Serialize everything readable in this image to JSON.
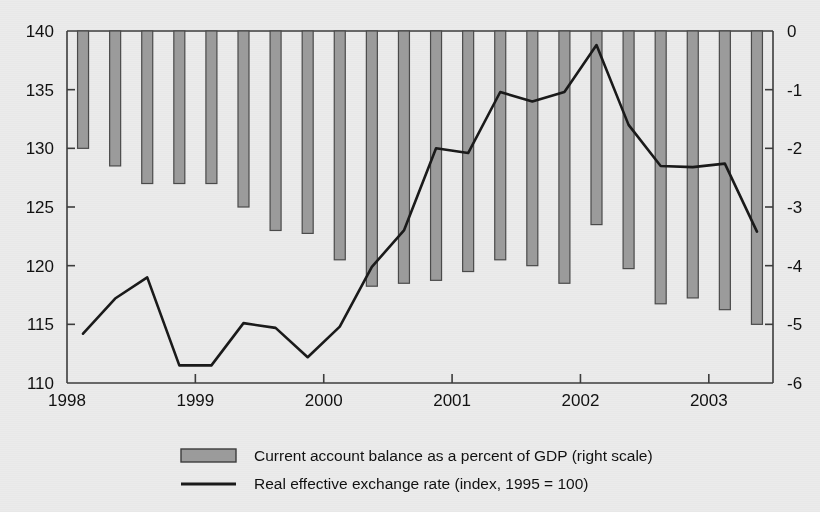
{
  "chart_data": {
    "type": "bar",
    "title": "",
    "subtitle": "",
    "xlabel": "",
    "ylabel": "",
    "grid": false,
    "legend_position": "bottom",
    "x_tick_labels": [
      "1998",
      "1999",
      "2000",
      "2001",
      "2002",
      "2003"
    ],
    "x_tick_values": [
      1998,
      1999,
      2000,
      2001,
      2002,
      2003
    ],
    "x_range": [
      1998.0,
      2003.5
    ],
    "left_axis": {
      "label": "Real effective exchange rate (index, 1995 = 100)",
      "ticks": [
        110,
        115,
        120,
        125,
        130,
        135,
        140
      ],
      "tick_labels": [
        "110",
        "115",
        "120",
        "125",
        "130",
        "135",
        "140"
      ],
      "ylim": [
        110,
        140
      ]
    },
    "right_axis": {
      "label": "Current account balance as a percent of GDP (right scale)",
      "ticks": [
        0,
        -1,
        -2,
        -3,
        -4,
        -5,
        -6
      ],
      "tick_labels": [
        "0",
        "-1",
        "-2",
        "-3",
        "-4",
        "-5",
        "-6"
      ],
      "ylim": [
        -6,
        0
      ]
    },
    "x": [
      1998.125,
      1998.375,
      1998.625,
      1998.875,
      1999.125,
      1999.375,
      1999.625,
      1999.875,
      2000.125,
      2000.375,
      2000.625,
      2000.875,
      2001.125,
      2001.375,
      2001.625,
      2001.875,
      2002.125,
      2002.375,
      2002.625,
      2002.875,
      2003.125,
      2003.375
    ],
    "series": [
      {
        "name": "Current account balance as a percent of GDP (right scale)",
        "axis": "right",
        "type": "bar",
        "color": "#9b9b9b",
        "edge_color": "#4a4a4a",
        "values": [
          -2.0,
          -2.3,
          -2.6,
          -2.6,
          -2.6,
          -3.0,
          -3.4,
          -3.45,
          -3.9,
          -4.35,
          -4.3,
          -4.25,
          -4.1,
          -3.9,
          -4.0,
          -4.3,
          -3.3,
          -4.05,
          -4.65,
          -4.55,
          -4.75,
          -5.0
        ]
      },
      {
        "name": "Real effective exchange rate (index, 1995 = 100)",
        "axis": "left",
        "type": "line",
        "color": "#1a1a1a",
        "values": [
          114.2,
          117.2,
          119.0,
          111.5,
          111.5,
          115.1,
          114.7,
          112.2,
          114.8,
          119.9,
          123.0,
          130.0,
          129.6,
          134.8,
          134.0,
          134.8,
          138.8,
          132.0,
          128.5,
          128.4,
          128.7,
          122.9
        ]
      }
    ]
  },
  "legend": {
    "items": [
      {
        "marker": "bar-swatch",
        "label": "Current account balance as a percent of GDP (right scale)"
      },
      {
        "marker": "line-swatch",
        "label": "Real effective exchange rate (index, 1995 = 100)"
      }
    ]
  },
  "colors": {
    "background": "#ebebeb",
    "axis": "#3c3c3c",
    "bar_fill": "#9b9b9b",
    "bar_edge": "#4a4a4a",
    "line": "#1a1a1a",
    "text": "#111111"
  }
}
